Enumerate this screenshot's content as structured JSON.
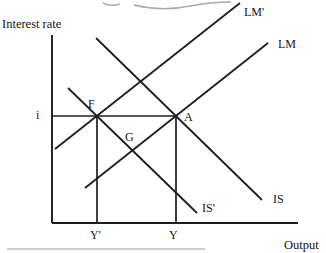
{
  "figure": {
    "name": "IS-LM diagram",
    "width": 326,
    "height": 253,
    "background": "#ffffff",
    "ink": "#1d1d1d",
    "faint": "#a8a8a8",
    "label_font_size": 12,
    "axis_label_font_size": 12.5
  },
  "axes": {
    "y_axis": {
      "x1": 52,
      "y1": 35,
      "x2": 52,
      "y2": 223,
      "label": "Interest rate",
      "label_x": 2,
      "label_y": 28
    },
    "x_axis": {
      "x1": 52,
      "y1": 223,
      "x2": 298,
      "y2": 223,
      "label": "Output",
      "label_x": 284,
      "label_y": 249
    }
  },
  "curves": [
    {
      "id": "lm-prime-curve",
      "label": "LM'",
      "x1": 55,
      "y1": 149,
      "x2": 240,
      "y2": 3,
      "label_x": 244,
      "label_y": 16
    },
    {
      "id": "lm-curve",
      "label": "LM",
      "x1": 85,
      "y1": 188,
      "x2": 268,
      "y2": 43,
      "label_x": 278,
      "label_y": 48
    },
    {
      "id": "is-curve",
      "label": "IS",
      "x1": 96,
      "y1": 38,
      "x2": 262,
      "y2": 200,
      "label_x": 273,
      "label_y": 203
    },
    {
      "id": "is-prime-curve",
      "label": "IS'",
      "x1": 68,
      "y1": 88,
      "x2": 197,
      "y2": 213,
      "label_x": 202,
      "label_y": 212
    }
  ],
  "guides": [
    {
      "id": "interest-level-line",
      "x1": 52,
      "y1": 116,
      "x2": 176,
      "y2": 116
    },
    {
      "id": "output-prime-drop-line",
      "x1": 97,
      "y1": 116,
      "x2": 97,
      "y2": 223
    },
    {
      "id": "output-drop-line",
      "x1": 176,
      "y1": 116,
      "x2": 176,
      "y2": 223
    }
  ],
  "point_labels": [
    {
      "id": "interest-rate-i-label",
      "text": "i",
      "x": 36,
      "y": 119
    },
    {
      "id": "point-f-label",
      "text": "F",
      "x": 88,
      "y": 108
    },
    {
      "id": "point-a-label",
      "text": "A",
      "x": 184,
      "y": 121
    },
    {
      "id": "point-g-label",
      "text": "G",
      "x": 125,
      "y": 141
    },
    {
      "id": "output-y-prime-label",
      "text": "Y'",
      "x": 90,
      "y": 239
    },
    {
      "id": "output-y-label",
      "text": "Y",
      "x": 169,
      "y": 239
    }
  ],
  "artifacts": {
    "top_cropped_text_path": "M103,3 Q111,7 120,4 M134,5 Q162,12 190,6 Q210,2 231,2",
    "bottom_cropped_rule": {
      "x1": 7,
      "y1": 249,
      "x2": 205,
      "y2": 249
    }
  }
}
